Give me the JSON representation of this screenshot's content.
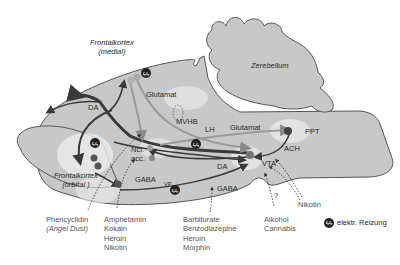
{
  "regions": {
    "frontal_medial": {
      "line1": "Frontalkortex",
      "line2": "(medial)"
    },
    "frontal_orbital": {
      "line1": "Frontalkortex",
      "line2": "(orbital )"
    },
    "cerebellum": "Zerebellum"
  },
  "nodes": {
    "ncl_acc": {
      "line1": "Ncl.",
      "line2": "acc."
    },
    "vta": "VTA",
    "vp": "VP",
    "ppt": "PPT",
    "lh": "LH",
    "mvhb": "MVHB"
  },
  "pathways": {
    "da_upper": "DA",
    "da_lower": "DA",
    "glutamat_upper": "Glutamat",
    "glutamat_lower": "Glutamat",
    "gaba_left": "GABA",
    "gaba_right": "GABA",
    "ach": "ACH",
    "question": "?"
  },
  "drugs": {
    "phencyclidin": {
      "line1": "Phencyclidin",
      "line2": "(Angel Dust)"
    },
    "stimulants": [
      "Amphetamin",
      "Kokain",
      "Heroin",
      "Nikotin"
    ],
    "sedatives": [
      "Barbiturate",
      "Benzodiazepine",
      "Heroin",
      "Morphin"
    ],
    "alcohol": [
      "Alkohol",
      "Cannabis"
    ],
    "nikotin": "Nikotin"
  },
  "legend": {
    "icon": "lightning-stimulation-icon",
    "label": "elektr. Reizung"
  },
  "colors": {
    "brain_fill": "#c8c8c8",
    "outline": "#555555",
    "dark_path": "#3a3a3a",
    "light_path": "#aaaaaa",
    "glow": "#ececec"
  }
}
